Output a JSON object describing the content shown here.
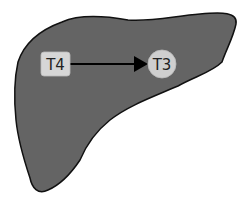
{
  "diagram": {
    "organ": "liver",
    "colors": {
      "liver_fill": "#646464",
      "liver_outline": "#111111",
      "node_fill_t4": "#d6d6d6",
      "node_fill_t3": "#cfcfcf",
      "arrow": "#000000",
      "background": "#ffffff"
    },
    "nodes": [
      {
        "id": "t4",
        "label": "T4",
        "shape": "rounded-rect"
      },
      {
        "id": "t3",
        "label": "T3",
        "shape": "circle"
      }
    ],
    "edges": [
      {
        "from": "t4",
        "to": "t3",
        "type": "arrow"
      }
    ]
  }
}
